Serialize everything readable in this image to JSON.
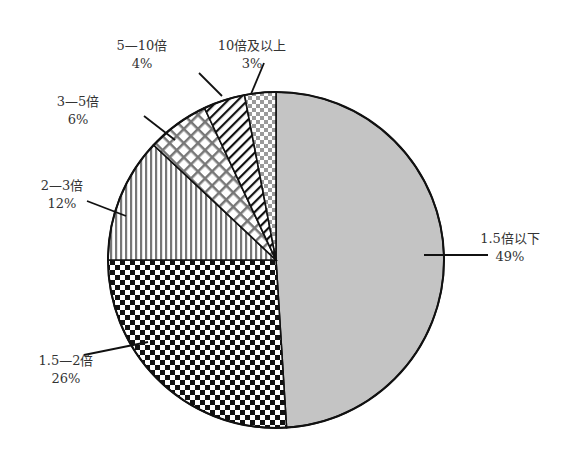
{
  "chart_data": {
    "type": "pie",
    "title": "",
    "start_angle_deg": 0,
    "direction": "clockwise",
    "categories": [
      "1.5倍以下",
      "1.5—2倍",
      "2—3倍",
      "3—5倍",
      "5—10倍",
      "10倍及以上"
    ],
    "values": [
      49,
      26,
      12,
      6,
      4,
      3
    ],
    "unit": "%",
    "slices": [
      {
        "label": "1.5倍以下",
        "value": 49,
        "value_label": "49%",
        "pattern": "light-gray-solid"
      },
      {
        "label": "1.5—2倍",
        "value": 26,
        "value_label": "26%",
        "pattern": "black-checkerboard"
      },
      {
        "label": "2—3倍",
        "value": 12,
        "value_label": "12%",
        "pattern": "vertical-stripes"
      },
      {
        "label": "3—5倍",
        "value": 6,
        "value_label": "6%",
        "pattern": "diagonal-crosshatch"
      },
      {
        "label": "5—10倍",
        "value": 4,
        "value_label": "4%",
        "pattern": "diagonal-stripes"
      },
      {
        "label": "10倍及以上",
        "value": 3,
        "value_label": "3%",
        "pattern": "gray-checkerboard"
      }
    ],
    "legend": "none",
    "colors": {
      "outline": "#111111",
      "light_fill": "#c4c4c4",
      "text": "#333333"
    }
  }
}
